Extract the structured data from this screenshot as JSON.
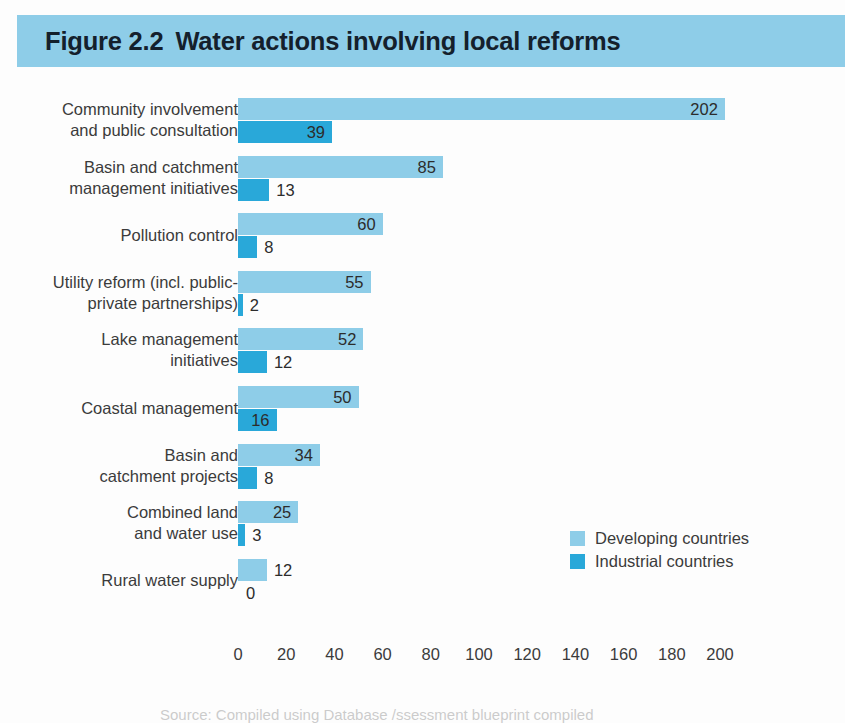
{
  "figure": {
    "number": "Figure 2.2",
    "title": "Water actions involving local reforms",
    "banner_color": "#8ecde8",
    "title_color": "#14202c"
  },
  "legend": {
    "position": "middle-right",
    "entries": [
      {
        "label": "Developing countries",
        "color": "#8ecde8",
        "swatch_name": "legend-swatch-developing"
      },
      {
        "label": "Industrial countries",
        "color": "#29a8d9",
        "swatch_name": "legend-swatch-industrial"
      }
    ]
  },
  "source_note": "Source: Compiled using Database /ssessment blueprint compiled",
  "chart_data": {
    "type": "bar",
    "orientation": "horizontal",
    "grouped": true,
    "xlabel": "",
    "ylabel": "",
    "xlim": [
      0,
      200
    ],
    "xticks": [
      0,
      20,
      40,
      60,
      80,
      100,
      120,
      140,
      160,
      180,
      200
    ],
    "xtick_labels": [
      "0",
      "20",
      "40",
      "60",
      "80",
      "100",
      "120",
      "140",
      "160",
      "180",
      "200"
    ],
    "grid": false,
    "categories": [
      "Community involvement\nand public consultation",
      "Basin and catchment\nmanagement initiatives",
      "Pollution control",
      "Utility reform (incl. public-\nprivate partnerships)",
      "Lake management\ninitiatives",
      "Coastal management",
      "Basin and\ncatchment projects",
      "Combined land\nand water use",
      "Rural water supply"
    ],
    "series": [
      {
        "name": "Developing countries",
        "color": "#8ecde8",
        "values": [
          202,
          85,
          60,
          55,
          52,
          50,
          34,
          25,
          12
        ]
      },
      {
        "name": "Industrial countries",
        "color": "#29a8d9",
        "values": [
          39,
          13,
          8,
          2,
          12,
          16,
          8,
          3,
          0
        ]
      }
    ],
    "data_labels": {
      "developing": [
        "202",
        "85",
        "60",
        "55",
        "52",
        "50",
        "34",
        "25",
        "12"
      ],
      "industrial": [
        "39",
        "13",
        "8",
        "2",
        "12",
        "16",
        "8",
        "3",
        "0"
      ]
    }
  }
}
